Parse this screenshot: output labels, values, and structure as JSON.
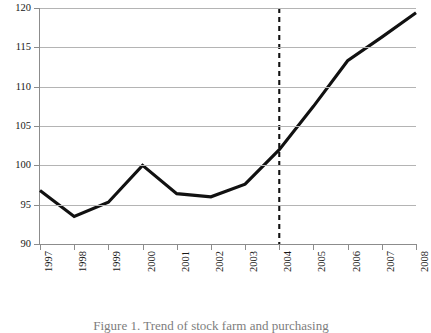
{
  "chart_data": {
    "type": "line",
    "title": "",
    "xlabel": "",
    "ylabel": "",
    "categories": [
      "1997",
      "1998",
      "1999",
      "2000",
      "2001",
      "2002",
      "2003",
      "2004",
      "2005",
      "2006",
      "2007",
      "2008"
    ],
    "values": [
      96.8,
      93.5,
      95.3,
      100.0,
      96.4,
      96.0,
      97.6,
      102.0,
      107.5,
      113.3,
      116.3,
      119.4
    ],
    "series": [
      {
        "name": "index",
        "values": [
          96.8,
          93.5,
          95.3,
          100.0,
          96.4,
          96.0,
          97.6,
          102.0,
          107.5,
          113.3,
          116.3,
          119.4
        ]
      }
    ],
    "ylim": [
      90,
      120
    ],
    "ytick_values": [
      90,
      95,
      100,
      105,
      110,
      115,
      120
    ],
    "ytick_labels": [
      "90",
      "95",
      "100",
      "105",
      "110",
      "115",
      "120"
    ],
    "xtick_labels": [
      "1997",
      "1998",
      "1999",
      "2000",
      "2001",
      "2002",
      "2003",
      "2004",
      "2005",
      "2006",
      "2007",
      "2008"
    ],
    "grid": true,
    "legend": false,
    "legend_position": "none",
    "annotations": [
      {
        "type": "vertical-reference-line",
        "style": "dashed",
        "at_category": "2004",
        "color": "#111111"
      }
    ],
    "line_color": "#111111",
    "grid_color": "#b4b4b4",
    "axis_color": "#8c8c8c"
  },
  "caption": {
    "text": "Figure 1. Trend of stock farm and purchasing"
  }
}
